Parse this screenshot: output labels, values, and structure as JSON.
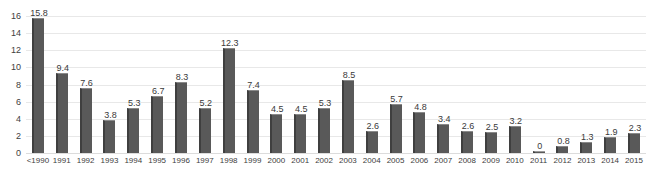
{
  "chart_data": {
    "type": "bar",
    "title": "",
    "xlabel": "",
    "ylabel": "",
    "ylim": [
      0,
      16
    ],
    "yticks": [
      0,
      2,
      4,
      6,
      8,
      10,
      12,
      14,
      16
    ],
    "grid": true,
    "legend": "none",
    "bar_color": "#595959",
    "gridline_color": "#e8e8e8",
    "categories": [
      "<1990",
      "1991",
      "1992",
      "1993",
      "1994",
      "1995",
      "1996",
      "1997",
      "1998",
      "1999",
      "2000",
      "2001",
      "2002",
      "2003",
      "2004",
      "2005",
      "2006",
      "2007",
      "2008",
      "2009",
      "2010",
      "2011",
      "2012",
      "2013",
      "2014",
      "2015"
    ],
    "values": [
      15.8,
      9.4,
      7.6,
      3.8,
      5.3,
      6.7,
      8.3,
      5.2,
      12.3,
      7.4,
      4.5,
      4.5,
      5.3,
      8.5,
      2.6,
      5.7,
      4.8,
      3.4,
      2.6,
      2.5,
      3.2,
      0,
      0.8,
      1.3,
      1.9,
      2.3
    ],
    "data_labels": [
      "15.8",
      "9.4",
      "7.6",
      "3.8",
      "5.3",
      "6.7",
      "8.3",
      "5.2",
      "12.3",
      "7.4",
      "4.5",
      "4.5",
      "5.3",
      "8.5",
      "2.6",
      "5.7",
      "4.8",
      "3.4",
      "2.6",
      "2.5",
      "3.2",
      "0",
      "0.8",
      "1.3",
      "1.9",
      "2.3"
    ]
  }
}
